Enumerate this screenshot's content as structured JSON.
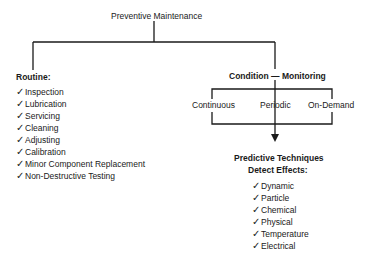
{
  "root": {
    "label": "Preventive Maintenance"
  },
  "routine": {
    "title": "Routine:",
    "check_icon": "check-icon",
    "items": [
      "Inspection",
      "Lubrication",
      "Servicing",
      "Cleaning",
      "Adjusting",
      "Calibration",
      "Minor Component Replacement",
      "Non-Destructive Testing"
    ]
  },
  "condition": {
    "title": "Condition — Monitoring",
    "modes": [
      "Continuous",
      "Periodic",
      "On-Demand"
    ]
  },
  "predictive": {
    "title_line1": "Predictive Techniques",
    "title_line2": "Detect Effects:",
    "items": [
      "Dynamic",
      "Particle",
      "Chemical",
      "Physical",
      "Temperature",
      "Electrical"
    ]
  },
  "colors": {
    "line": "#1a1a1a",
    "text": "#1a1a1a",
    "background": "#ffffff"
  }
}
